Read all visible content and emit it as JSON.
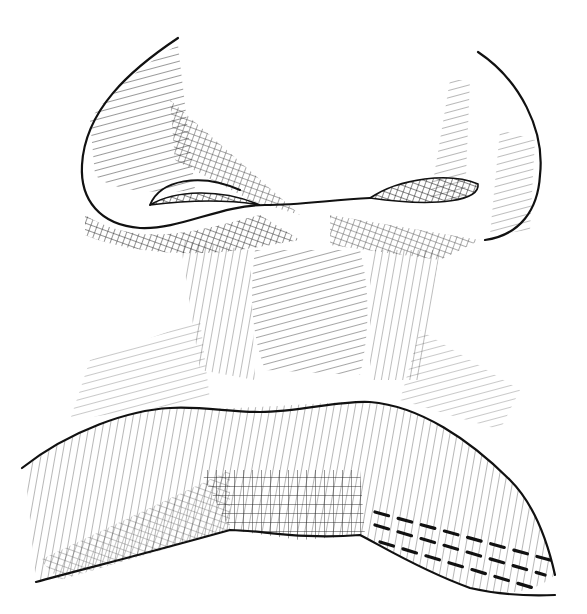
{
  "image": {
    "subject": "pen-and-ink illustration of a nose and upper lip",
    "style": "cross-hatching line drawing",
    "colors": {
      "ink": "#111111",
      "paper": "#ffffff"
    }
  }
}
